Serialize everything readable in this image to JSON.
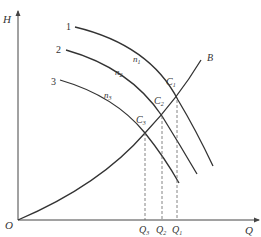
{
  "diagram": {
    "axes": {
      "y_label": "H",
      "x_label": "Q",
      "origin_label": "O"
    },
    "pump_curves": [
      {
        "id": "1",
        "label": "1",
        "speed_label": "n",
        "speed_sub": "1"
      },
      {
        "id": "2",
        "label": "2",
        "speed_label": "n",
        "speed_sub": "2"
      },
      {
        "id": "3",
        "label": "3",
        "speed_label": "n",
        "speed_sub": "3"
      }
    ],
    "system_curve": {
      "label": "B"
    },
    "operating_points": [
      {
        "label": "C",
        "sub": "1"
      },
      {
        "label": "C",
        "sub": "2"
      },
      {
        "label": "C",
        "sub": "3"
      }
    ],
    "flow_marks": [
      {
        "label": "Q",
        "sub": "3"
      },
      {
        "label": "Q",
        "sub": "2"
      },
      {
        "label": "Q",
        "sub": "1"
      }
    ],
    "colors": {
      "line": "#333333",
      "dash": "#666666",
      "background": "#ffffff"
    }
  }
}
